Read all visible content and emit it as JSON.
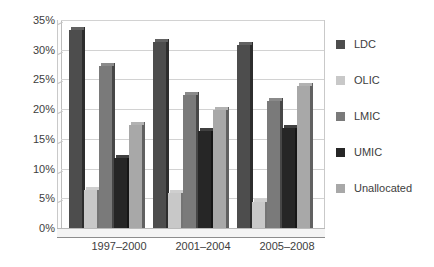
{
  "chart_data": {
    "type": "bar",
    "title": "",
    "subtitle": "",
    "xlabel": "",
    "ylabel": "",
    "categories": [
      "1997–2000",
      "2001–2004",
      "2005–2008"
    ],
    "series": [
      {
        "name": "LDC",
        "color": "#4d4d4d",
        "values": [
          34.0,
          32.0,
          31.5
        ]
      },
      {
        "name": "OLIC",
        "color": "#c8c8c8",
        "values": [
          7.0,
          6.5,
          5.0
        ]
      },
      {
        "name": "LMIC",
        "color": "#7a7a7a",
        "values": [
          28.0,
          23.0,
          22.0
        ]
      },
      {
        "name": "UMIC",
        "color": "#262626",
        "values": [
          12.5,
          17.0,
          17.5
        ]
      },
      {
        "name": "Unallocated",
        "color": "#a8a8a8",
        "values": [
          18.0,
          20.5,
          24.5
        ]
      }
    ],
    "ylim": [
      0,
      35
    ],
    "ytick_step": 5,
    "yticks": [
      "0%",
      "5%",
      "10%",
      "15%",
      "20%",
      "25%",
      "30%",
      "35%"
    ],
    "grid": true,
    "legend_position": "right",
    "value_suffix": "%"
  }
}
